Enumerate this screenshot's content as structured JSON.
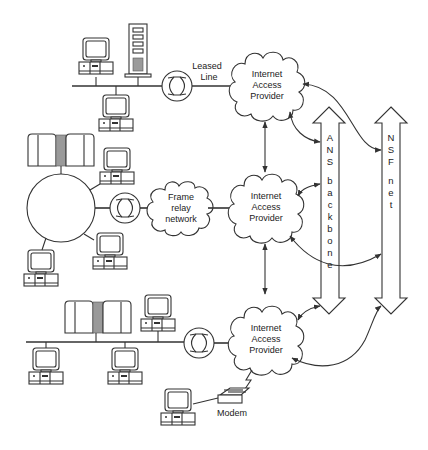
{
  "diagram": {
    "labels": {
      "leased_line_1": "Leased",
      "leased_line_2": "Line",
      "frame_relay_1": "Frame",
      "frame_relay_2": "relay",
      "frame_relay_3": "network",
      "modem": "Modem"
    },
    "providers": [
      {
        "id": "iap-top",
        "line1": "Internet",
        "line2": "Access",
        "line3": "Provider"
      },
      {
        "id": "iap-middle",
        "line1": "Internet",
        "line2": "Access",
        "line3": "Provider"
      },
      {
        "id": "iap-bottom",
        "line1": "Internet",
        "line2": "Access",
        "line3": "Provider"
      }
    ],
    "backbones": [
      {
        "id": "ans-backbone",
        "letters": [
          "A",
          "N",
          "S",
          "",
          "b",
          "a",
          "c",
          "k",
          "b",
          "o",
          "n",
          "e"
        ]
      },
      {
        "id": "nsf-net",
        "letters": [
          "N",
          "S",
          "F",
          "",
          "n",
          "e",
          "t"
        ]
      }
    ],
    "nodes": {
      "top_lan": [
        "workstation",
        "tower-server",
        "workstation"
      ],
      "ring_lan": [
        "mainframe",
        "workstation",
        "workstation",
        "workstation"
      ],
      "bottom_lan": [
        "mainframe",
        "workstation",
        "workstation",
        "workstation"
      ],
      "dialup": [
        "workstation",
        "modem"
      ]
    },
    "colors": {
      "line": "#333333",
      "background": "#ffffff",
      "shade": "#9a9a9a"
    }
  }
}
